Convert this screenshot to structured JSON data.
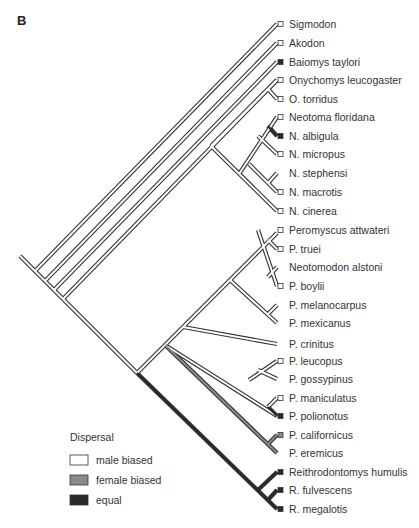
{
  "panel_label": "B",
  "colors": {
    "male_biased": "#ffffff",
    "female_biased": "#8a8a8a",
    "equal": "#2a2a2a",
    "outline": "#333333"
  },
  "legend": {
    "title": "Dispersal",
    "items": [
      {
        "label": "male biased",
        "state": "male_biased"
      },
      {
        "label": "female biased",
        "state": "female_biased"
      },
      {
        "label": "equal",
        "state": "equal"
      }
    ]
  },
  "tips": [
    {
      "name": "Sigmodon",
      "y": 24,
      "state": "male_biased",
      "marker": true
    },
    {
      "name": "Akodon",
      "y": 43,
      "state": "male_biased",
      "marker": true
    },
    {
      "name": "Baiomys taylori",
      "y": 62,
      "state": "equal",
      "marker": true
    },
    {
      "name": "Onychomys leucogaster",
      "y": 80,
      "state": "male_biased",
      "marker": true
    },
    {
      "name": "O. torridus",
      "y": 99,
      "state": "male_biased",
      "marker": true
    },
    {
      "name": "Neotoma floridana",
      "y": 117,
      "state": "male_biased",
      "marker": true
    },
    {
      "name": "N. albigula",
      "y": 136,
      "state": "equal",
      "marker": true
    },
    {
      "name": "N. micropus",
      "y": 154,
      "state": "male_biased",
      "marker": true
    },
    {
      "name": "N. stephensi",
      "y": 173,
      "state": "male_biased",
      "marker": false
    },
    {
      "name": "N. macrotis",
      "y": 192,
      "state": "male_biased",
      "marker": true
    },
    {
      "name": "N. cinerea",
      "y": 211,
      "state": "male_biased",
      "marker": true
    },
    {
      "name": "Peromyscus attwateri",
      "y": 230,
      "state": "male_biased",
      "marker": true
    },
    {
      "name": "P. truei",
      "y": 249,
      "state": "male_biased",
      "marker": true
    },
    {
      "name": "Neotomodon alstoni",
      "y": 267,
      "state": "male_biased",
      "marker": false
    },
    {
      "name": "P. boylii",
      "y": 286,
      "state": "male_biased",
      "marker": true
    },
    {
      "name": "P. melanocarpus",
      "y": 305,
      "state": "male_biased",
      "marker": false
    },
    {
      "name": "P. mexicanus",
      "y": 323,
      "state": "male_biased",
      "marker": false
    },
    {
      "name": "P. crinitus",
      "y": 344,
      "state": "male_biased",
      "marker": false
    },
    {
      "name": "P. leucopus",
      "y": 361,
      "state": "male_biased",
      "marker": true
    },
    {
      "name": "P. gossypinus",
      "y": 379,
      "state": "male_biased",
      "marker": false
    },
    {
      "name": "P. maniculatus",
      "y": 398,
      "state": "male_biased",
      "marker": true
    },
    {
      "name": "P. polionotus",
      "y": 416,
      "state": "equal",
      "marker": true
    },
    {
      "name": "P. californicus",
      "y": 435,
      "state": "female_biased",
      "marker": true
    },
    {
      "name": "P. eremicus",
      "y": 453,
      "state": "female_biased",
      "marker": false
    },
    {
      "name": "Reithrodontomys humulis",
      "y": 472,
      "state": "equal",
      "marker": true
    },
    {
      "name": "R. fulvescens",
      "y": 490,
      "state": "equal",
      "marker": true
    },
    {
      "name": "R. megalotis",
      "y": 509,
      "state": "equal",
      "marker": true
    }
  ],
  "branches": [
    {
      "from": [
        20,
        256
      ],
      "to": [
        137,
        373
      ],
      "state": "male_biased"
    },
    {
      "from": [
        35,
        271
      ],
      "to": [
        277,
        24
      ],
      "state": "male_biased"
    },
    {
      "from": [
        45,
        281
      ],
      "to": [
        277,
        43
      ],
      "state": "male_biased"
    },
    {
      "from": [
        54,
        290
      ],
      "to": [
        277,
        62
      ],
      "state": "male_biased"
    },
    {
      "from": [
        63,
        299
      ],
      "to": [
        277,
        80
      ],
      "state": "male_biased"
    },
    {
      "from": [
        268,
        89
      ],
      "to": [
        277,
        99
      ],
      "state": "male_biased"
    },
    {
      "from": [
        211,
        146
      ],
      "to": [
        277,
        80
      ],
      "state": "male_biased"
    },
    {
      "from": [
        211,
        146
      ],
      "to": [
        277,
        211
      ],
      "state": "male_biased"
    },
    {
      "from": [
        239,
        174
      ],
      "to": [
        277,
        117
      ],
      "state": "male_biased"
    },
    {
      "from": [
        258,
        136
      ],
      "to": [
        277,
        154
      ],
      "state": "male_biased"
    },
    {
      "from": [
        268,
        126
      ],
      "to": [
        277,
        136
      ],
      "state": "equal"
    },
    {
      "from": [
        249,
        164
      ],
      "to": [
        277,
        192
      ],
      "state": "male_biased"
    },
    {
      "from": [
        268,
        183
      ],
      "to": [
        277,
        173
      ],
      "state": "male_biased"
    },
    {
      "from": [
        137,
        373
      ],
      "to": [
        277,
        233
      ],
      "state": "male_biased"
    },
    {
      "from": [
        268,
        240
      ],
      "to": [
        277,
        249
      ],
      "state": "male_biased"
    },
    {
      "from": [
        258,
        230
      ],
      "to": [
        277,
        286
      ],
      "state": "male_biased"
    },
    {
      "from": [
        268,
        277
      ],
      "to": [
        277,
        267
      ],
      "state": "male_biased"
    },
    {
      "from": [
        230,
        280
      ],
      "to": [
        277,
        323
      ],
      "state": "male_biased"
    },
    {
      "from": [
        268,
        314
      ],
      "to": [
        277,
        305
      ],
      "state": "male_biased"
    },
    {
      "from": [
        183,
        327
      ],
      "to": [
        277,
        344
      ],
      "state": "male_biased"
    },
    {
      "from": [
        165,
        345
      ],
      "to": [
        277,
        416
      ],
      "state": "male_biased"
    },
    {
      "from": [
        249,
        380
      ],
      "to": [
        277,
        361
      ],
      "state": "male_biased"
    },
    {
      "from": [
        258,
        370
      ],
      "to": [
        277,
        379
      ],
      "state": "male_biased"
    },
    {
      "from": [
        268,
        407
      ],
      "to": [
        277,
        398
      ],
      "state": "male_biased"
    },
    {
      "from": [
        268,
        407
      ],
      "to": [
        277,
        416
      ],
      "state": "equal"
    },
    {
      "from": [
        165,
        345
      ],
      "to": [
        277,
        453
      ],
      "state": "female_biased"
    },
    {
      "from": [
        268,
        444
      ],
      "to": [
        277,
        435
      ],
      "state": "female_biased"
    },
    {
      "from": [
        137,
        373
      ],
      "to": [
        277,
        509
      ],
      "state": "equal"
    },
    {
      "from": [
        258,
        490
      ],
      "to": [
        277,
        472
      ],
      "state": "equal"
    },
    {
      "from": [
        268,
        500
      ],
      "to": [
        277,
        490
      ],
      "state": "equal"
    }
  ]
}
